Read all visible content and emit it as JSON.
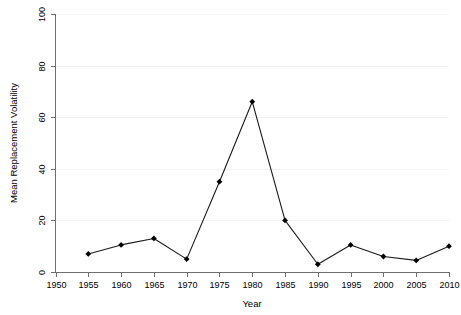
{
  "chart_data": {
    "type": "line",
    "title": "",
    "subtitle": "",
    "xlabel": "Year",
    "ylabel": "Mean Replacement Volatility",
    "x": [
      1955,
      1960,
      1965,
      1970,
      1975,
      1980,
      1985,
      1990,
      1995,
      2000,
      2005,
      2010
    ],
    "values": [
      7,
      10.5,
      13,
      5,
      35,
      66,
      20,
      3,
      10.5,
      6,
      4.5,
      10
    ],
    "series": [
      {
        "name": "Mean Replacement Volatility",
        "values": [
          7,
          10.5,
          13,
          5,
          35,
          66,
          20,
          3,
          10.5,
          6,
          4.5,
          10
        ]
      }
    ],
    "xlim": [
      1950,
      2010
    ],
    "ylim": [
      0,
      100
    ],
    "xticks": [
      1950,
      1955,
      1960,
      1965,
      1970,
      1975,
      1980,
      1985,
      1990,
      1995,
      2000,
      2005,
      2010
    ],
    "yticks": [
      0,
      20,
      40,
      60,
      80,
      100
    ],
    "xtick_labels": [
      "1950",
      "1955",
      "1960",
      "1965",
      "1970",
      "1975",
      "1980",
      "1985",
      "1990",
      "1995",
      "2000",
      "2005",
      "2010"
    ],
    "ytick_labels": [
      "0",
      "20",
      "40",
      "60",
      "80",
      "100"
    ],
    "grid": "horizontal",
    "legend": "none",
    "marker": "filled-diamond",
    "line_color": "#1a1a1a",
    "marker_color": "#000000",
    "grid_color": "#f2f2f2",
    "axis_color": "#6e6e6e",
    "background_color": "#ffffff"
  }
}
